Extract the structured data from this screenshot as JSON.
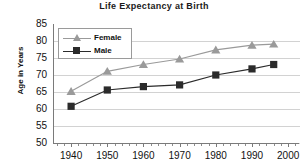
{
  "chart_data": {
    "type": "line",
    "title": "Life Expectancy at Birth",
    "xlabel": "",
    "ylabel": "Age in Years",
    "xlim": [
      1935,
      2003
    ],
    "ylim": [
      50,
      85
    ],
    "ytick_step": 5,
    "xtick_step": 10,
    "grid": true,
    "legend_position": "upper-left-inside",
    "x": [
      1940,
      1950,
      1960,
      1970,
      1980,
      1990,
      1996
    ],
    "xticks": [
      "1940",
      "1950",
      "1960",
      "1970",
      "1980",
      "1990",
      "2000"
    ],
    "yticks": [
      "50",
      "55",
      "60",
      "65",
      "70",
      "75",
      "80",
      "85"
    ],
    "series": [
      {
        "name": "Female",
        "marker": "triangle",
        "color": "#9a9a9a",
        "values": [
          65.2,
          71.1,
          73.1,
          74.7,
          77.4,
          78.8,
          79.1
        ]
      },
      {
        "name": "Male",
        "marker": "square",
        "color": "#2b2b2b",
        "values": [
          60.8,
          65.6,
          66.6,
          67.1,
          70.0,
          71.8,
          73.1
        ]
      }
    ]
  },
  "legend": {
    "items": [
      {
        "label": "Female"
      },
      {
        "label": "Male"
      }
    ]
  },
  "colors": {
    "female": "#9a9a9a",
    "male": "#2b2b2b",
    "grid": "#d2d2d2",
    "axis": "#7a7a7a",
    "text": "#111111",
    "background": "#ffffff"
  }
}
